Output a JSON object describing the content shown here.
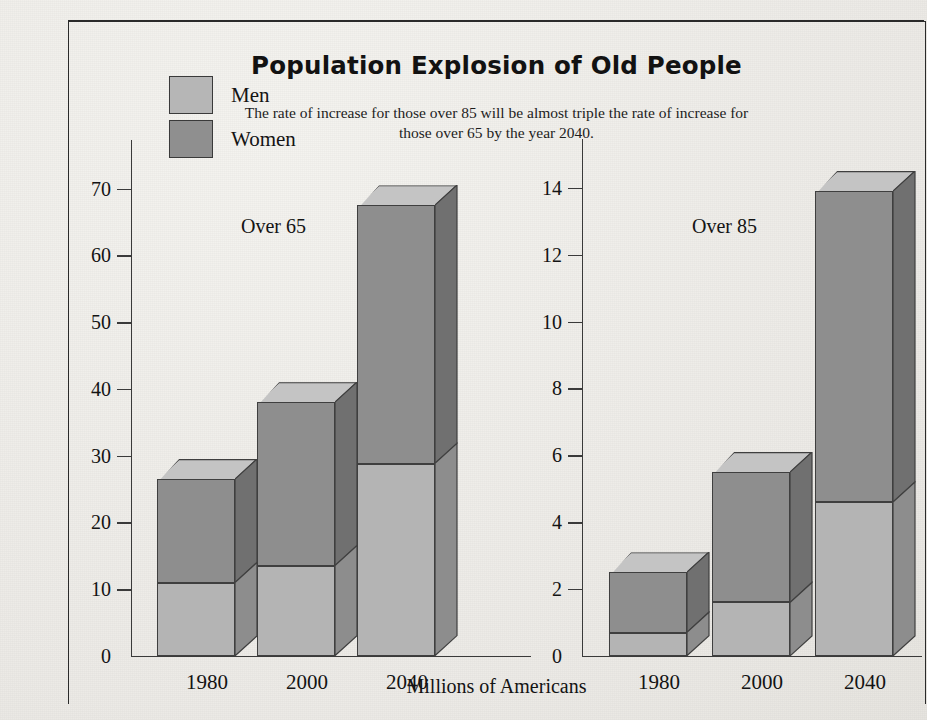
{
  "title": "Population Explosion of Old People",
  "subtitle": "The rate of increase for those over 85 will be almost triple the rate of increase for those over 65 by the year 2040.",
  "legend": {
    "items": [
      {
        "label": "Men",
        "color": "#b4b4b4"
      },
      {
        "label": "Women",
        "color": "#8e8e8e"
      }
    ]
  },
  "axis_title": "Millions of Americans",
  "panels": [
    {
      "caption": "Over 65",
      "ticks": [
        "0",
        "10",
        "20",
        "30",
        "40",
        "50",
        "60",
        "70"
      ],
      "categories": [
        "1980",
        "2000",
        "2040"
      ]
    },
    {
      "caption": "Over 85",
      "ticks": [
        "0",
        "2",
        "4",
        "6",
        "8",
        "10",
        "12",
        "14"
      ],
      "categories": [
        "1980",
        "2000",
        "2040"
      ]
    }
  ],
  "chart_data": {
    "type": "bar",
    "title": "Population Explosion of Old People",
    "subtitle": "The rate of increase for those over 85 will be almost triple the rate of increase for those over 65 by the year 2040.",
    "xlabel": "Millions of Americans",
    "ylabel": "",
    "stacked": true,
    "grid": false,
    "legend_position": "top-left",
    "legend": [
      "Men",
      "Women"
    ],
    "panels": [
      {
        "name": "Over 65",
        "categories": [
          "1980",
          "2000",
          "2040"
        ],
        "ylim": [
          0,
          74
        ],
        "yticks": [
          0,
          10,
          20,
          30,
          40,
          50,
          60,
          70
        ],
        "series": [
          {
            "name": "Men",
            "values": [
              11.0,
              13.5,
              28.8
            ]
          },
          {
            "name": "Women",
            "values": [
              15.5,
              24.5,
              38.7
            ]
          }
        ],
        "totals": [
          26.5,
          38.0,
          67.5
        ]
      },
      {
        "name": "Over 85",
        "categories": [
          "1980",
          "2000",
          "2040"
        ],
        "ylim": [
          0,
          14.8
        ],
        "yticks": [
          0,
          2,
          4,
          6,
          8,
          10,
          12,
          14
        ],
        "series": [
          {
            "name": "Men",
            "values": [
              0.7,
              1.6,
              4.6
            ]
          },
          {
            "name": "Women",
            "values": [
              1.8,
              3.9,
              9.3
            ]
          }
        ],
        "totals": [
          2.5,
          5.5,
          13.9
        ]
      }
    ]
  }
}
